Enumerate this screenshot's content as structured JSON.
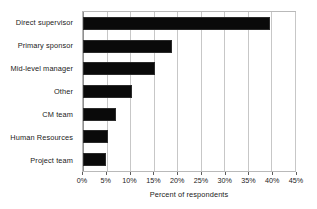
{
  "chart_data": {
    "type": "bar",
    "orientation": "horizontal",
    "title": "",
    "xlabel": "Percent of respondents",
    "ylabel": "",
    "categories": [
      "Direct supervisor",
      "Primary sponsor",
      "Mid-level manager",
      "Other",
      "CM team",
      "Human Resources",
      "Project team"
    ],
    "values": [
      39.7,
      18.8,
      15.3,
      10.5,
      6.9,
      5.3,
      4.8
    ],
    "value_unit": "%",
    "xlim": [
      0,
      45
    ],
    "xticks": [
      0,
      5,
      10,
      15,
      20,
      25,
      30,
      35,
      40,
      45
    ],
    "xtick_labels": [
      "0%",
      "5%",
      "10%",
      "15%",
      "20%",
      "25%",
      "30%",
      "35%",
      "40%",
      "45%"
    ],
    "grid": true,
    "grid_axis": "x",
    "legend": false,
    "bar_color": "#0a0a0a",
    "bar_edge_color": "#2b2b2b",
    "grid_color": "#c7c7c7",
    "plot_border_color": "#b9b9b9",
    "background_color": "#ffffff"
  }
}
